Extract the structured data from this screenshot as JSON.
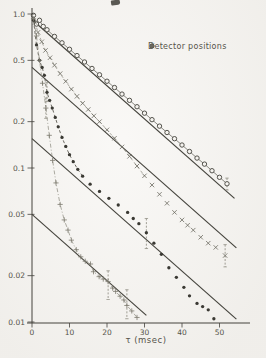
{
  "figure": {
    "background": "#f5f3ef",
    "ink": "#44433c",
    "mid_ink": "#5c5a51",
    "faint_ink": "#8a887c",
    "text_color": "#55534a"
  },
  "legend": {
    "title": "Detector positions",
    "items": [
      {
        "symbol": "open-circle"
      },
      {
        "symbol": "cross"
      },
      {
        "symbol": "filled-circle"
      },
      {
        "symbol": "plus"
      }
    ]
  },
  "chart_data": {
    "type": "scatter",
    "title": "",
    "xlabel": "τ (msec)",
    "ylabel": "",
    "x_ticks": [
      0,
      10,
      20,
      30,
      40,
      50
    ],
    "x_range": [
      0,
      58
    ],
    "y_scale": "log",
    "y_ticks": [
      1.0,
      0.5,
      0.2,
      0.1,
      0.05,
      0.02,
      0.01
    ],
    "y_tick_labels": [
      "1.0",
      "0.5",
      "0.2",
      "0.1",
      "0.05",
      "0.02",
      "0.01"
    ],
    "y_range": [
      0.0095,
      1.05
    ],
    "grid": false,
    "legend_position": "upper-right",
    "fit_slope_decades_per_msec": 0.0215,
    "fit_lines": [
      {
        "name": "fit-line-1",
        "v0": 0.92,
        "tau": [
          0.5,
          54.0
        ]
      },
      {
        "name": "fit-line-2",
        "v0": 0.45,
        "tau": [
          0.0,
          54.5
        ]
      },
      {
        "name": "fit-line-3",
        "v0": 0.155,
        "tau": [
          0.0,
          54.5
        ]
      },
      {
        "name": "fit-line-4",
        "v0": 0.05,
        "tau": [
          0.0,
          30.5
        ]
      }
    ],
    "series": [
      {
        "name": "detector-position-1",
        "symbol": "open-circle",
        "connector": {
          "style": "solid",
          "upto": 52
        },
        "points": [
          [
            0.4,
            0.98
          ],
          [
            1.2,
            0.86
          ],
          [
            2.0,
            0.91
          ],
          [
            3.0,
            0.83
          ],
          [
            4,
            0.79
          ],
          [
            6,
            0.715
          ],
          [
            8,
            0.65
          ],
          [
            10,
            0.59
          ],
          [
            12,
            0.537
          ],
          [
            14,
            0.488
          ],
          [
            16,
            0.443
          ],
          [
            18,
            0.403
          ],
          [
            20,
            0.366
          ],
          [
            22,
            0.333
          ],
          [
            24,
            0.302
          ],
          [
            26,
            0.275
          ],
          [
            28,
            0.25
          ],
          [
            30,
            0.227
          ],
          [
            32,
            0.206
          ],
          [
            34,
            0.187
          ],
          [
            36,
            0.17
          ],
          [
            38,
            0.155
          ],
          [
            40,
            0.141
          ],
          [
            42,
            0.128
          ],
          [
            44,
            0.116
          ],
          [
            46,
            0.106
          ],
          [
            48,
            0.096
          ],
          [
            50,
            0.087
          ],
          [
            52,
            0.079
          ]
        ]
      },
      {
        "name": "detector-position-2",
        "symbol": "cross",
        "connector": {
          "style": "dashed",
          "upto": 30
        },
        "points": [
          [
            0.8,
            0.88
          ],
          [
            1.6,
            0.76
          ],
          [
            2.6,
            0.66
          ],
          [
            3.6,
            0.58
          ],
          [
            4.8,
            0.52
          ],
          [
            6,
            0.465
          ],
          [
            7.5,
            0.41
          ],
          [
            9,
            0.365
          ],
          [
            10.5,
            0.325
          ],
          [
            12,
            0.292
          ],
          [
            13.5,
            0.263
          ],
          [
            15,
            0.24
          ],
          [
            16.5,
            0.218
          ],
          [
            18,
            0.2
          ],
          [
            20,
            0.177
          ],
          [
            22,
            0.156
          ],
          [
            24,
            0.137
          ],
          [
            26,
            0.119
          ],
          [
            28,
            0.103
          ],
          [
            30,
            0.089
          ],
          [
            32,
            0.0775
          ],
          [
            34,
            0.0675
          ],
          [
            36,
            0.059
          ],
          [
            38,
            0.0515
          ],
          [
            40,
            0.046
          ],
          [
            41.5,
            0.0425
          ],
          [
            43,
            0.0395
          ],
          [
            45,
            0.0355
          ],
          [
            47,
            0.0325
          ],
          [
            49,
            0.0305
          ],
          [
            51.5,
            0.027
          ]
        ]
      },
      {
        "name": "detector-position-3",
        "symbol": "filled-circle",
        "connector": {
          "style": "dashed",
          "upto": 13.5
        },
        "points": [
          [
            0.4,
            0.91
          ],
          [
            1.2,
            0.63
          ],
          [
            2.0,
            0.5
          ],
          [
            2.7,
            0.45
          ],
          [
            3.3,
            0.4
          ],
          [
            4.0,
            0.31
          ],
          [
            4.7,
            0.275
          ],
          [
            5.4,
            0.245
          ],
          [
            6.2,
            0.213
          ],
          [
            7.0,
            0.185
          ],
          [
            8.0,
            0.158
          ],
          [
            9.0,
            0.138
          ],
          [
            10,
            0.122
          ],
          [
            11,
            0.11
          ],
          [
            12.2,
            0.098
          ],
          [
            13.5,
            0.0885
          ],
          [
            15.5,
            0.0785
          ],
          [
            18,
            0.0705
          ],
          [
            20.5,
            0.0635
          ],
          [
            23,
            0.0575
          ],
          [
            25.5,
            0.0515
          ],
          [
            27,
            0.047
          ],
          [
            28.5,
            0.0435
          ],
          [
            30.5,
            0.038
          ],
          [
            32.5,
            0.0325
          ],
          [
            34.5,
            0.0275
          ],
          [
            36.5,
            0.0225
          ],
          [
            38.5,
            0.0195
          ],
          [
            40.5,
            0.0168
          ],
          [
            42,
            0.0148
          ],
          [
            44,
            0.0132
          ],
          [
            45.5,
            0.0126
          ],
          [
            47,
            0.012
          ],
          [
            48.5,
            0.0105
          ]
        ]
      },
      {
        "name": "detector-position-4",
        "symbol": "plus",
        "connector": {
          "style": "dashdot",
          "upto": 28
        },
        "points": [
          [
            0.4,
            0.93
          ],
          [
            1.2,
            0.72
          ],
          [
            2.0,
            0.5
          ],
          [
            2.8,
            0.355
          ],
          [
            3.7,
            0.245
          ],
          [
            4.6,
            0.163
          ],
          [
            5.5,
            0.112
          ],
          [
            6.4,
            0.08
          ],
          [
            7.5,
            0.058
          ],
          [
            8.6,
            0.046
          ],
          [
            9.6,
            0.0395
          ],
          [
            10.5,
            0.034
          ],
          [
            11.8,
            0.0295
          ],
          [
            13,
            0.0265
          ],
          [
            14.2,
            0.0248
          ],
          [
            15.6,
            0.0238
          ],
          [
            16.4,
            0.0212
          ],
          [
            17.9,
            0.0197
          ],
          [
            19,
            0.019
          ],
          [
            20.3,
            0.0183
          ],
          [
            21.5,
            0.0166
          ],
          [
            22.3,
            0.0158
          ],
          [
            23.5,
            0.0147
          ],
          [
            24.5,
            0.0139
          ],
          [
            25.3,
            0.0128
          ],
          [
            26.6,
            0.0118
          ],
          [
            28,
            0.0107
          ]
        ]
      }
    ],
    "error_bars": [
      {
        "series": "filled-circle",
        "tau": 4.0,
        "lo": 0.27,
        "hi": 0.36
      },
      {
        "series": "plus",
        "tau": 3.7,
        "lo": 0.21,
        "hi": 0.285
      },
      {
        "series": "plus",
        "tau": 20.3,
        "lo": 0.014,
        "hi": 0.0215
      },
      {
        "series": "plus",
        "tau": 25.3,
        "lo": 0.0105,
        "hi": 0.0162
      },
      {
        "series": "filled-circle",
        "tau": 30.5,
        "lo": 0.03,
        "hi": 0.047
      },
      {
        "series": "cross",
        "tau": 51.5,
        "lo": 0.0228,
        "hi": 0.0318
      },
      {
        "series": "open-circle",
        "tau": 52.0,
        "lo": 0.072,
        "hi": 0.086
      }
    ]
  }
}
